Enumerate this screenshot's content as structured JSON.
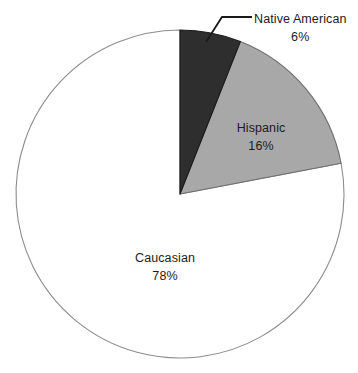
{
  "chart_data": {
    "type": "pie",
    "title": "",
    "xlabel": "",
    "ylabel": "",
    "grid": false,
    "legend": "none",
    "label_mode": "slice-labels-with-callout",
    "start_angle_deg": 0,
    "direction": "clockwise",
    "center": {
      "x": 180,
      "y": 194
    },
    "radius": 164,
    "categories": [
      "Native American",
      "Hispanic",
      "Caucasian"
    ],
    "values": [
      6,
      16,
      78
    ],
    "value_suffix": "%",
    "slices": [
      {
        "label": "Native American",
        "value": 6,
        "value_text": "6%",
        "color": "#2e2e2e",
        "stroke": "#1a1a1a",
        "label_placement": "outside-callout"
      },
      {
        "label": "Hispanic",
        "value": 16,
        "value_text": "16%",
        "color": "#a8a8a8",
        "stroke": "#6e6e6e",
        "label_placement": "inside"
      },
      {
        "label": "Caucasian",
        "value": 78,
        "value_text": "78%",
        "color": "#ffffff",
        "stroke": "#8c8c8c",
        "label_placement": "inside"
      }
    ]
  },
  "labels": {
    "native_american": {
      "name": "Native American",
      "value": "6%"
    },
    "hispanic": {
      "name": "Hispanic",
      "value": "16%"
    },
    "caucasian": {
      "name": "Caucasian",
      "value": "78%"
    }
  },
  "colors": {
    "native_american": "#2e2e2e",
    "hispanic": "#a8a8a8",
    "caucasian": "#ffffff",
    "outline": "#8c8c8c",
    "leader_line": "#1a1a1a",
    "text": "#1c1c1c",
    "background": "#ffffff"
  }
}
